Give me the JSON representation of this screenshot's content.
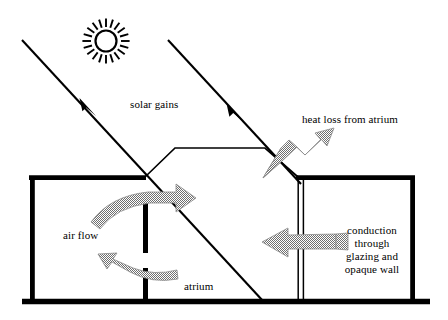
{
  "diagram": {
    "canvas": {
      "width": 448,
      "height": 320
    },
    "colors": {
      "stroke": "#000000",
      "arrow_fill": "#9a9a9a",
      "arrow_edge": "#8a8a8a",
      "background": "#ffffff"
    },
    "labels": {
      "solar_gains": "solar gains",
      "heat_loss": "heat loss from atrium",
      "air_flow": "air flow",
      "atrium": "atrium",
      "conduction_line1": "conduction",
      "conduction_line2": "through",
      "conduction_line3": "glazing and",
      "conduction_line4": "opaque wall"
    },
    "icons": {
      "sun": "sun-icon",
      "solar_ray_1": "solar-ray-arrow-icon",
      "solar_ray_2": "solar-ray-arrow-icon",
      "heat_loss_arrow": "heat-loss-arrow-icon",
      "air_flow_upper_arrow": "air-flow-upper-arrow-icon",
      "air_flow_lower_arrow": "air-flow-lower-arrow-icon",
      "conduction_arrow": "conduction-arrow-icon"
    },
    "geometry": {
      "ground_line": {
        "x1": 22,
        "y1": 302,
        "x2": 430,
        "y2": 302
      },
      "left_building": {
        "x": 31,
        "y": 176,
        "width": 114,
        "height": 126
      },
      "right_building": {
        "x": 298,
        "y": 176,
        "width": 115,
        "height": 126
      },
      "atrium_roof": [
        [
          145,
          177
        ],
        [
          175,
          148
        ],
        [
          265,
          148
        ],
        [
          298,
          177
        ]
      ],
      "sun": {
        "cx": 106,
        "cy": 41,
        "r": 11,
        "rays": 20
      }
    }
  }
}
